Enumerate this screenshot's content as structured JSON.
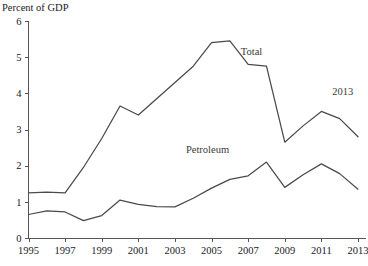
{
  "chart_data": {
    "type": "line",
    "title": "",
    "ylabel": "Percent of GDP",
    "xlabel": "",
    "ylim": [
      0,
      6
    ],
    "xlim": [
      1995,
      2013
    ],
    "ytick_labels": [
      "0",
      "1",
      "2",
      "3",
      "4",
      "5",
      "6"
    ],
    "yticks": [
      0,
      1,
      2,
      3,
      4,
      5,
      6
    ],
    "xtick_labels": [
      "1995",
      "1997",
      "1999",
      "2001",
      "2003",
      "2005",
      "2007",
      "2009",
      "2011",
      "2013"
    ],
    "xticks": [
      1995,
      1997,
      1999,
      2001,
      2003,
      2005,
      2007,
      2009,
      2011,
      2013
    ],
    "grid": false,
    "legend_position": "inline-annotations",
    "x": [
      1995,
      1996,
      1997,
      1998,
      1999,
      2000,
      2001,
      2002,
      2003,
      2004,
      2005,
      2006,
      2007,
      2008,
      2009,
      2010,
      2011,
      2012,
      2013
    ],
    "series": [
      {
        "name": "Total",
        "color": "#4a4a4a",
        "values": [
          1.25,
          1.27,
          1.25,
          1.95,
          2.75,
          3.65,
          3.4,
          3.85,
          4.3,
          4.75,
          5.4,
          5.45,
          4.8,
          4.75,
          2.65,
          3.1,
          3.5,
          3.3,
          2.8
        ],
        "label": "Total",
        "label_x": 2006.6,
        "label_y": 5.05
      },
      {
        "name": "Petroleum",
        "color": "#4a4a4a",
        "values": [
          0.65,
          0.75,
          0.72,
          0.48,
          0.62,
          1.05,
          0.93,
          0.87,
          0.86,
          1.1,
          1.38,
          1.62,
          1.72,
          2.1,
          1.4,
          1.75,
          2.05,
          1.78,
          1.35
        ],
        "label": "Petroleum",
        "label_x": 2003.6,
        "label_y": 2.35
      }
    ],
    "annotations": [
      {
        "text": "2013",
        "x": 2011.6,
        "y": 3.95
      }
    ]
  }
}
